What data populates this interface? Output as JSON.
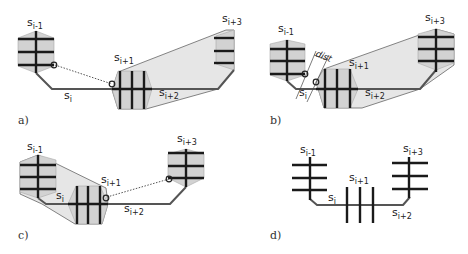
{
  "panels": [
    {
      "id": "a",
      "caption": "a)",
      "labels": {
        "s_im1": "s",
        "s_im1_sub": "i-1",
        "s_i": "s",
        "s_i_sub": "i",
        "s_ip1": "s",
        "s_ip1_sub": "i+1",
        "s_ip2": "s",
        "s_ip2_sub": "i+2",
        "s_ip3": "s",
        "s_ip3_sub": "i+3"
      }
    },
    {
      "id": "b",
      "caption": "b)",
      "labels": {
        "s_im1": "s",
        "s_im1_sub": "i-1",
        "s_i": "s",
        "s_i_sub": "i",
        "s_ip1": "s",
        "s_ip1_sub": "i+1",
        "s_ip2": "s",
        "s_ip2_sub": "i+2",
        "s_ip3": "s",
        "s_ip3_sub": "i+3",
        "dist": "dist"
      }
    },
    {
      "id": "c",
      "caption": "c)",
      "labels": {
        "s_im1": "s",
        "s_im1_sub": "i-1",
        "s_i": "s",
        "s_i_sub": "i",
        "s_ip1": "s",
        "s_ip1_sub": "i+1",
        "s_ip2": "s",
        "s_ip2_sub": "i+2",
        "s_ip3": "s",
        "s_ip3_sub": "i+3"
      }
    },
    {
      "id": "d",
      "caption": "d)",
      "labels": {
        "s_im1": "s",
        "s_im1_sub": "i-1",
        "s_i": "s",
        "s_i_sub": "i",
        "s_ip1": "s",
        "s_ip1_sub": "i+1",
        "s_ip2": "s",
        "s_ip2_sub": "i+2",
        "s_ip3": "s",
        "s_ip3_sub": "i+3"
      }
    }
  ],
  "colors": {
    "hull_fill": "#e6e6e6",
    "hex_fill": "#d2d2d2",
    "bar": "#1a1a1a",
    "path": "#555555"
  }
}
